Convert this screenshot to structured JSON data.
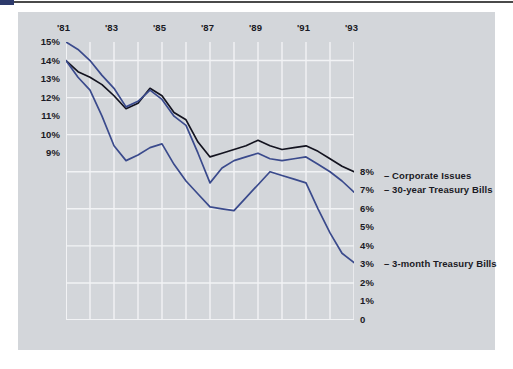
{
  "figure": {
    "background": "#ffffff",
    "card_color": "#d3d6da",
    "grid_color": "#f2f3f5"
  },
  "chart_data": {
    "type": "line",
    "title": "",
    "subtitle": "",
    "xlabel": "",
    "ylabel": "",
    "grid": true,
    "legend_position": "right-inline",
    "xlim": [
      1981,
      1993
    ],
    "ylim": [
      0,
      15
    ],
    "x_tick_labels": [
      "'81",
      "'83",
      "'85",
      "'87",
      "'89",
      "'91",
      "'93"
    ],
    "x_tick_values": [
      1981,
      1983,
      1985,
      1987,
      1989,
      1991,
      1993
    ],
    "y_tick_labels_left": [
      "15%",
      "14%",
      "13%",
      "12%",
      "11%",
      "10%",
      "9%"
    ],
    "y_tick_values_left": [
      15,
      14,
      13,
      12,
      11,
      10,
      9
    ],
    "y_tick_labels_right": [
      "8%",
      "7%",
      "6%",
      "5%",
      "4%",
      "3%",
      "2%",
      "1%",
      "0"
    ],
    "y_tick_values_right": [
      8,
      7,
      6,
      5,
      4,
      3,
      2,
      1,
      0
    ],
    "x": [
      1981,
      1981.5,
      1982,
      1982.5,
      1983,
      1983.5,
      1984,
      1984.5,
      1985,
      1985.5,
      1986,
      1986.5,
      1987,
      1987.5,
      1988,
      1988.5,
      1989,
      1989.5,
      1990,
      1990.5,
      1991,
      1991.5,
      1992,
      1992.5,
      1993
    ],
    "series": [
      {
        "name": "Corporate Issues",
        "color": "#13131f",
        "label": "– Corporate Issues",
        "label_value": "8%",
        "values": [
          14.0,
          13.4,
          13.1,
          12.7,
          12.1,
          11.4,
          11.7,
          12.5,
          12.1,
          11.2,
          10.8,
          9.6,
          8.8,
          9.0,
          9.2,
          9.4,
          9.7,
          9.4,
          9.2,
          9.3,
          9.4,
          9.1,
          8.7,
          8.3,
          8.0
        ]
      },
      {
        "name": "30-year Treasury Bills",
        "color": "#3a4a8c",
        "label": "– 30-year Treasury Bills",
        "label_value": "7%",
        "values": [
          15.0,
          14.6,
          14.0,
          13.2,
          12.5,
          11.5,
          11.8,
          12.4,
          11.9,
          11.0,
          10.5,
          9.0,
          7.4,
          8.2,
          8.6,
          8.8,
          9.0,
          8.7,
          8.6,
          8.7,
          8.8,
          8.4,
          8.0,
          7.5,
          6.9
        ]
      },
      {
        "name": "3-month Treasury Bills",
        "color": "#3a4a8c",
        "label": "– 3-month Treasury Bills",
        "label_value": "3%",
        "values": [
          14.0,
          13.1,
          12.4,
          11.0,
          9.4,
          8.6,
          8.9,
          9.3,
          9.5,
          8.4,
          7.5,
          6.8,
          6.1,
          6.0,
          5.9,
          6.6,
          7.3,
          8.0,
          7.8,
          7.6,
          7.4,
          6.0,
          4.7,
          3.6,
          3.1
        ]
      }
    ]
  },
  "legend": {
    "entries": [
      {
        "value": "8%",
        "label": "– Corporate Issues"
      },
      {
        "value": "7%",
        "label": "– 30-year Treasury Bills"
      },
      {
        "value": "3%",
        "label": "– 3-month Treasury Bills"
      }
    ]
  }
}
